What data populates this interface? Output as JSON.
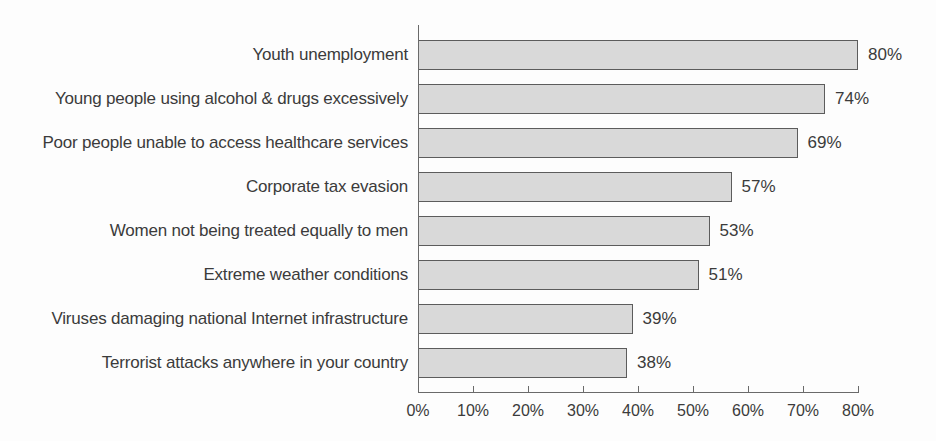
{
  "chart_data": {
    "type": "bar",
    "orientation": "horizontal",
    "title": "",
    "xlabel": "",
    "ylabel": "",
    "categories": [
      "Youth unemployment",
      "Young people using alcohol & drugs excessively",
      "Poor people unable to access healthcare services",
      "Corporate tax evasion",
      "Women not being treated equally to men",
      "Extreme weather conditions",
      "Viruses damaging national Internet infrastructure",
      "Terrorist attacks anywhere in your country"
    ],
    "values": [
      80,
      74,
      69,
      57,
      53,
      51,
      39,
      38
    ],
    "value_labels": [
      "80%",
      "74%",
      "69%",
      "57%",
      "53%",
      "51%",
      "39%",
      "38%"
    ],
    "xlim": [
      0,
      80
    ],
    "x_ticks": [
      {
        "value": 0,
        "label": "0%"
      },
      {
        "value": 10,
        "label": "10%"
      },
      {
        "value": 20,
        "label": "20%"
      },
      {
        "value": 30,
        "label": "30%"
      },
      {
        "value": 40,
        "label": "40%"
      },
      {
        "value": 50,
        "label": "50%"
      },
      {
        "value": 60,
        "label": "60%"
      },
      {
        "value": 70,
        "label": "70%"
      },
      {
        "value": 80,
        "label": "80%"
      }
    ],
    "grid": false,
    "legend": null,
    "colors": {
      "bar_fill": "#d9d9d9",
      "bar_border": "#5c5c5c",
      "axis": "#6a6a6a",
      "text": "#3b3b3b",
      "background": "#fdfdfd"
    }
  }
}
